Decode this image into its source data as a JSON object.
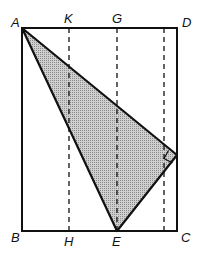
{
  "diagram": {
    "labels": {
      "A": "A",
      "K": "K",
      "G": "G",
      "D": "D",
      "B": "B",
      "H": "H",
      "E": "E",
      "C": "C"
    },
    "colors": {
      "stroke": "#111111",
      "fill": "#b8b8b8",
      "background": "#ffffff"
    }
  }
}
